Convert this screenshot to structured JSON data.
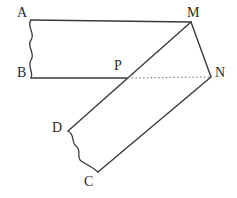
{
  "figure": {
    "stroke_color": "#3a3a3a",
    "dotted_color": "#6b6b6b",
    "background_color": "#ffffff",
    "stroke_width": 1.3,
    "canvas": {
      "width": 237,
      "height": 198
    }
  },
  "labels": {
    "A": "A",
    "B": "B",
    "C": "C",
    "D": "D",
    "M": "M",
    "N": "N",
    "P": "P"
  },
  "points": {
    "A": {
      "x": 31,
      "y": 20
    },
    "B": {
      "x": 31,
      "y": 78
    },
    "C": {
      "x": 98,
      "y": 172
    },
    "D": {
      "x": 68,
      "y": 131
    },
    "M": {
      "x": 191,
      "y": 22
    },
    "N": {
      "x": 211,
      "y": 77
    },
    "P": {
      "x": 127,
      "y": 78
    }
  },
  "label_positions": {
    "A": {
      "x": 17,
      "y": 6
    },
    "B": {
      "x": 17,
      "y": 66
    },
    "C": {
      "x": 84,
      "y": 175
    },
    "D": {
      "x": 52,
      "y": 121
    },
    "M": {
      "x": 187,
      "y": 6
    },
    "N": {
      "x": 215,
      "y": 66
    },
    "P": {
      "x": 114,
      "y": 59
    }
  },
  "edges": [
    {
      "name": "edge-AM",
      "from": "A",
      "to": "M",
      "style": "solid"
    },
    {
      "name": "edge-AB",
      "from": "A",
      "to": "B",
      "style": "wavy"
    },
    {
      "name": "edge-BP",
      "from": "B",
      "to": "P",
      "style": "solid"
    },
    {
      "name": "edge-MD",
      "from": "M",
      "to": "D",
      "style": "solid"
    },
    {
      "name": "edge-MN",
      "from": "M",
      "to": "N",
      "style": "solid"
    },
    {
      "name": "edge-PN",
      "from": "P",
      "to": "N",
      "style": "dotted"
    },
    {
      "name": "edge-NC",
      "from": "N",
      "to": "C",
      "style": "solid"
    },
    {
      "name": "edge-DC",
      "from": "D",
      "to": "C",
      "style": "wavy"
    }
  ]
}
